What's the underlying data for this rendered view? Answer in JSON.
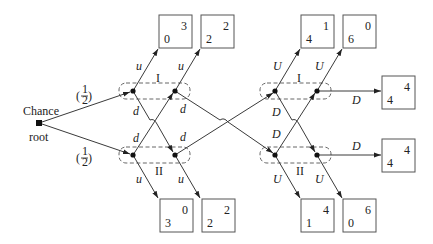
{
  "root": {
    "label_top": "Chance",
    "label_bottom": "root"
  },
  "chance_probs": {
    "upper": "1",
    "lower": "1",
    "denominator": "2"
  },
  "info_sets": {
    "left_upper": "I",
    "left_lower": "II",
    "right_upper": "I",
    "right_lower": "II"
  },
  "actions": {
    "left_u": "u",
    "left_d": "d",
    "right_U": "U",
    "right_D": "D"
  },
  "payoffs": {
    "top_left_1": {
      "p1": "0",
      "p2": "3"
    },
    "top_left_2": {
      "p1": "2",
      "p2": "2"
    },
    "top_right_1": {
      "p1": "4",
      "p2": "1"
    },
    "top_right_2": {
      "p1": "6",
      "p2": "0"
    },
    "right_upper": {
      "p1": "4",
      "p2": "4"
    },
    "right_lower": {
      "p1": "4",
      "p2": "4"
    },
    "bottom_left_1": {
      "p1": "3",
      "p2": "0"
    },
    "bottom_left_2": {
      "p1": "2",
      "p2": "2"
    },
    "bottom_right_1": {
      "p1": "1",
      "p2": "4"
    },
    "bottom_right_2": {
      "p1": "0",
      "p2": "6"
    }
  }
}
